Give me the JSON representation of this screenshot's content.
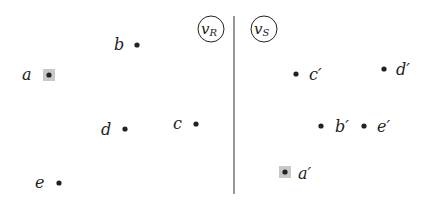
{
  "diagram": {
    "type": "point-mapping",
    "colors": {
      "ink": "#222222",
      "highlight": "#c8c8c8"
    },
    "left_panel": {
      "node_label": {
        "base": "v",
        "sub": "R"
      },
      "points": [
        {
          "id": "a",
          "label": "a",
          "highlighted": true
        },
        {
          "id": "b",
          "label": "b",
          "highlighted": false
        },
        {
          "id": "c",
          "label": "c",
          "highlighted": false
        },
        {
          "id": "d",
          "label": "d",
          "highlighted": false
        },
        {
          "id": "e",
          "label": "e",
          "highlighted": false
        }
      ]
    },
    "right_panel": {
      "node_label": {
        "base": "v",
        "sub": "S"
      },
      "points": [
        {
          "id": "c-prime",
          "label": "c′",
          "highlighted": false
        },
        {
          "id": "d-prime",
          "label": "d′",
          "highlighted": false
        },
        {
          "id": "b-prime",
          "label": "b′",
          "highlighted": false
        },
        {
          "id": "e-prime",
          "label": "e′",
          "highlighted": false
        },
        {
          "id": "a-prime",
          "label": "a′",
          "highlighted": true
        }
      ]
    }
  }
}
